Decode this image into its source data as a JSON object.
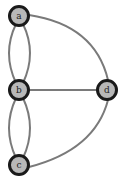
{
  "graph": {
    "nodes": [
      {
        "id": "a",
        "label": "a",
        "x": 19,
        "y": 16
      },
      {
        "id": "b",
        "label": "b",
        "x": 19,
        "y": 90
      },
      {
        "id": "d",
        "label": "d",
        "x": 107,
        "y": 90
      },
      {
        "id": "c",
        "label": "c",
        "x": 19,
        "y": 165
      }
    ],
    "edges": [
      {
        "from": "a",
        "to": "b",
        "type": "curve-left"
      },
      {
        "from": "a",
        "to": "b",
        "type": "curve-right"
      },
      {
        "from": "b",
        "to": "c",
        "type": "curve-left"
      },
      {
        "from": "b",
        "to": "c",
        "type": "curve-right"
      },
      {
        "from": "b",
        "to": "d",
        "type": "straight"
      },
      {
        "from": "a",
        "to": "d",
        "type": "arc"
      },
      {
        "from": "c",
        "to": "d",
        "type": "arc"
      }
    ],
    "colors": {
      "node_fill": "#b8b8b8",
      "node_stroke": "#1a1a1a",
      "edge": "#7a7a7a"
    }
  }
}
